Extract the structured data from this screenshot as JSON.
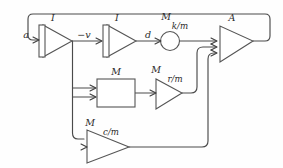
{
  "diagram": {
    "stroke_color": "#4a4a4a",
    "shape_fill": "#ffffff",
    "background": "#fefefe",
    "blocks": [
      {
        "id": "integrator-1",
        "type": "integrator-triangle",
        "label": "I"
      },
      {
        "id": "integrator-2",
        "type": "integrator-triangle",
        "label": "I"
      },
      {
        "id": "multiplier-k",
        "type": "multiplier-circle",
        "label": "M",
        "coefficient": "k/m"
      },
      {
        "id": "amplifier-a",
        "type": "amplifier-triangle",
        "label": "A"
      },
      {
        "id": "multiplier-block",
        "type": "multiplier-rect",
        "label": "M"
      },
      {
        "id": "multiplier-r",
        "type": "multiplier-triangle",
        "label": "M",
        "coefficient": "r/m"
      },
      {
        "id": "multiplier-c",
        "type": "multiplier-triangle",
        "label": "M",
        "coefficient": "c/m"
      }
    ],
    "signals": [
      {
        "id": "signal-a",
        "label": "a"
      },
      {
        "id": "signal-minus-v",
        "label": "−v"
      },
      {
        "id": "signal-d",
        "label": "d"
      }
    ]
  }
}
